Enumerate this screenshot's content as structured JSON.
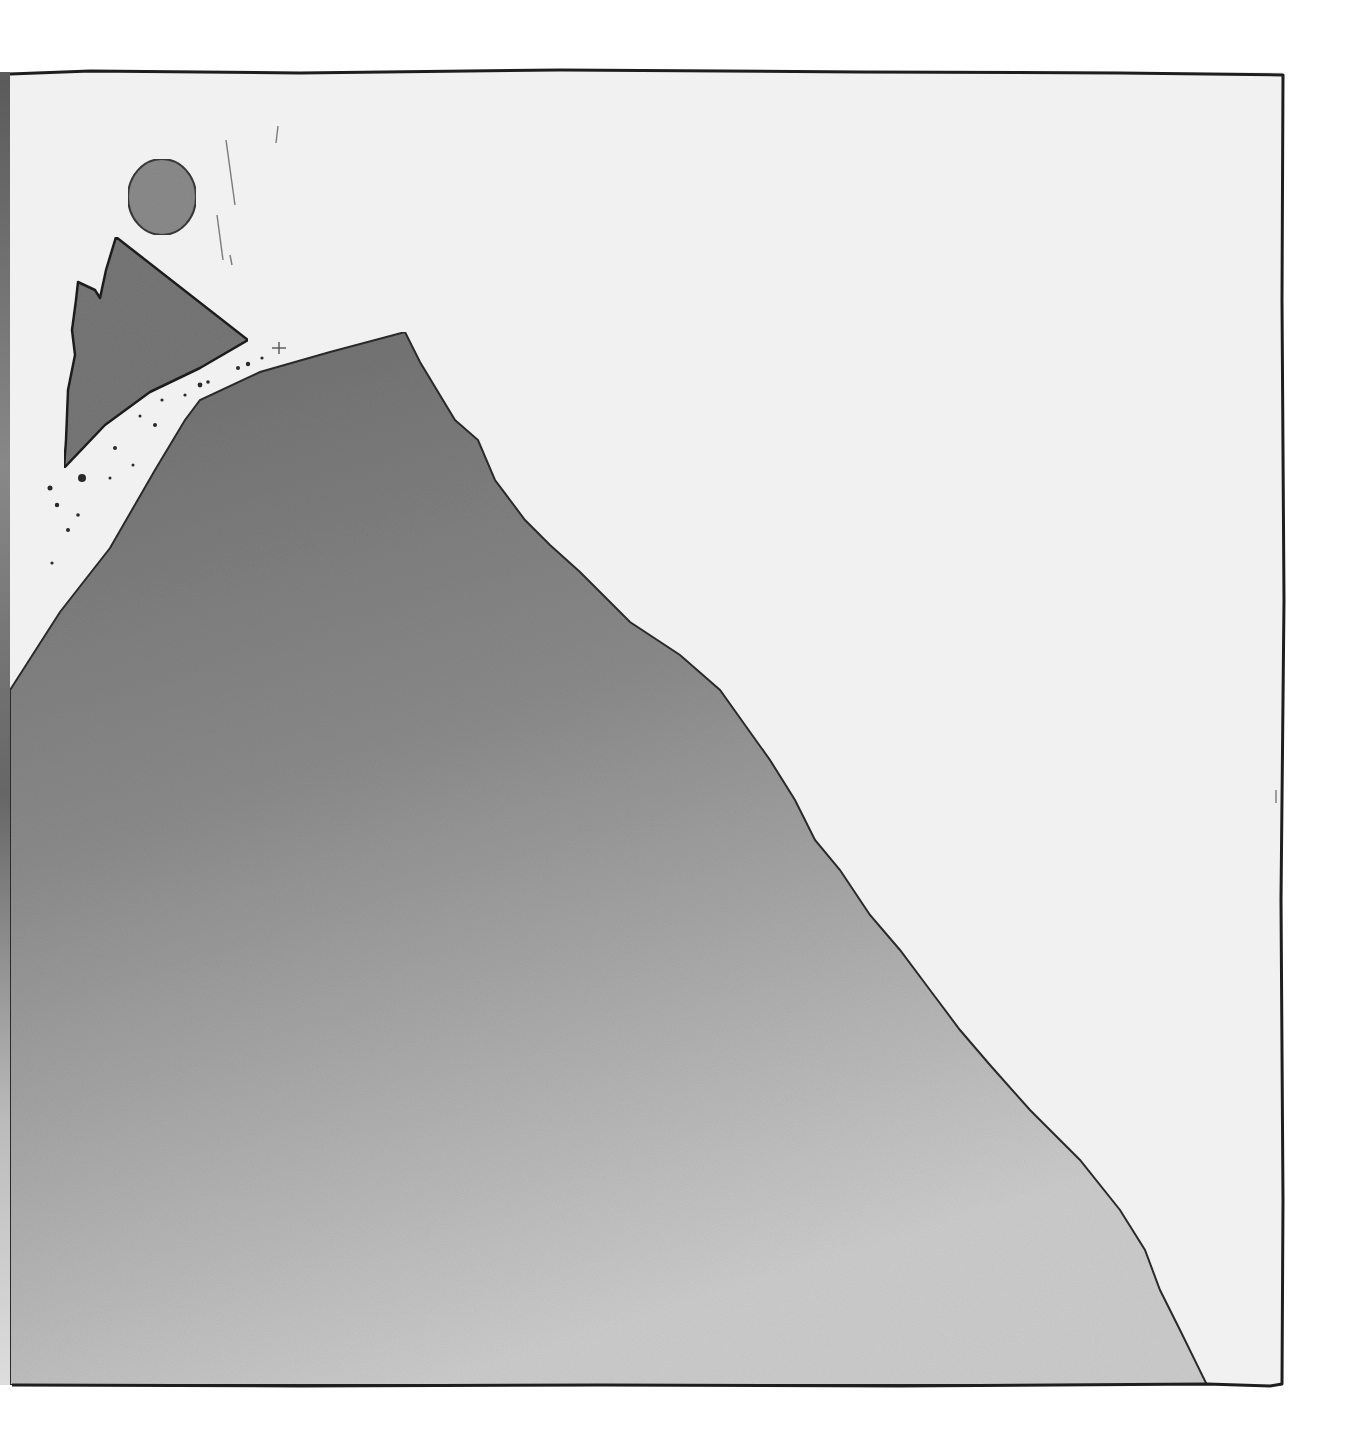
{
  "scene": {
    "description": "Hand-drawn ink-and-wash illustration: a large grey mountain slope rising from bottom-right to a peak at upper-left; a jagged rock fragment breaks off the summit, with a round stone falling above it, scattered debris dots and faint falling streak lines.",
    "elements": [
      "frame",
      "sky",
      "mountain",
      "falling-rock-fragment",
      "round-stone",
      "debris",
      "fall-streaks"
    ]
  },
  "colors": {
    "sky_paper": "#f1f1f1",
    "outside": "#ffffff",
    "mountain_top": "#6f6f6f",
    "mountain_mid": "#8c8c8c",
    "mountain_bottom": "#c9c9c9",
    "fragment": "#767676",
    "stone": "#8a8a8a",
    "ink": "#1e1e1e",
    "left_edge_shadow": "#6a6a6a"
  },
  "geometry": {
    "frame": {
      "left": 10,
      "top": 72,
      "right": 1283,
      "bottom": 1385
    },
    "peak": [
      405,
      332
    ],
    "stone_center": [
      162,
      196
    ],
    "fragment_tip": [
      248,
      340
    ]
  }
}
